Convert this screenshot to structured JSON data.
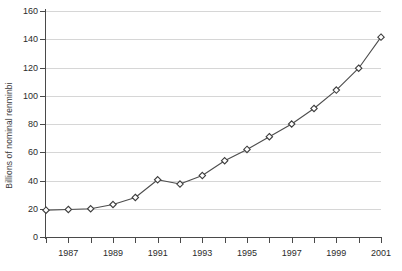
{
  "chart_data": {
    "type": "line",
    "title": "",
    "subtitle": "",
    "xlabel": "",
    "ylabel": "Billions of nominal renminbi",
    "x": [
      1986,
      1987,
      1988,
      1989,
      1990,
      1991,
      1992,
      1993,
      1994,
      1995,
      1996,
      1997,
      1998,
      1999,
      2000,
      2001
    ],
    "values": [
      19,
      19.5,
      20,
      23,
      28,
      40.5,
      37.5,
      43.5,
      54,
      62,
      71,
      80,
      91,
      104,
      119.5,
      141.5
    ],
    "series": [
      {
        "name": "Billions of nominal renminbi",
        "values": [
          19,
          19.5,
          20,
          23,
          28,
          40.5,
          37.5,
          43.5,
          54,
          62,
          71,
          80,
          91,
          104,
          119.5,
          141.5
        ]
      }
    ],
    "xlim": [
      1986,
      2001
    ],
    "ylim": [
      0,
      160
    ],
    "ytick_values": [
      0,
      20,
      40,
      60,
      80,
      100,
      120,
      140,
      160
    ],
    "ytick_labels": [
      "0",
      "20",
      "40",
      "60",
      "80",
      "100",
      "120",
      "140",
      "160"
    ],
    "xtick_values": [
      1986,
      1987,
      1988,
      1989,
      1990,
      1991,
      1992,
      1993,
      1994,
      1995,
      1996,
      1997,
      1998,
      1999,
      2000,
      2001
    ],
    "xtick_labels": [
      "",
      "1987",
      "",
      "1989",
      "",
      "1991",
      "",
      "1993",
      "",
      "1995",
      "",
      "1997",
      "",
      "1999",
      "",
      "2001"
    ],
    "grid": "horizontal",
    "legend": "none",
    "marker": "open-diamond",
    "colors": {
      "line": "#4d4d4d",
      "marker_fill": "#ffffff",
      "marker_stroke": "#3d3d3d",
      "gridline": "#d6d6d6",
      "axis": "#4a4a4a",
      "background": "#ffffff",
      "text": "#2b2b2b"
    }
  }
}
